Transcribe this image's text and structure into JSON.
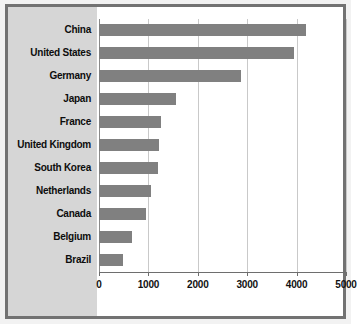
{
  "chart_data": {
    "type": "bar",
    "orientation": "horizontal",
    "title": "",
    "subtitle": "",
    "xlabel": "",
    "ylabel": "",
    "categories": [
      "China",
      "United States",
      "Germany",
      "Japan",
      "France",
      "United Kingdom",
      "South Korea",
      "Netherlands",
      "Canada",
      "Belgium",
      "Brazil"
    ],
    "values": [
      4200,
      3950,
      2880,
      1560,
      1250,
      1210,
      1190,
      1060,
      960,
      670,
      480
    ],
    "series": [
      {
        "name": "",
        "values": [
          4200,
          3950,
          2880,
          1560,
          1250,
          1210,
          1190,
          1060,
          960,
          670,
          480
        ]
      }
    ],
    "xlim": [
      0,
      5000
    ],
    "xticks": [
      0,
      1000,
      2000,
      3000,
      4000,
      5000
    ],
    "xtick_labels": [
      "0",
      "1000",
      "2000",
      "3000",
      "4000",
      "5000"
    ],
    "grid": true,
    "grid_axis": "x",
    "legend": false,
    "legend_position": "none",
    "annotations": []
  },
  "style": {
    "bar_color": "#808080",
    "label_panel_color": "#d6d6d6",
    "plot_background": "#ffffff",
    "frame_color": "#727272",
    "gridline_color": "#c9c9c9",
    "axis_color": "#6e6e6e",
    "text_color": "#0d0d0d"
  }
}
